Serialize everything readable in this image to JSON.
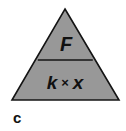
{
  "figure": {
    "caption_label": "c",
    "background_color": "#ffffff",
    "shape": {
      "name": "formula-triangle",
      "fill_color": "#989898",
      "stroke_color": "#141414",
      "stroke_width": 1.6,
      "apex": {
        "x": 65,
        "y": 9
      },
      "base_left": {
        "x": 12,
        "y": 100
      },
      "base_right": {
        "x": 119,
        "y": 100
      },
      "divider_y": 60,
      "divider_left_x": 37,
      "divider_right_x": 93
    },
    "compartments": {
      "top": {
        "name": "force-cell",
        "text": "F"
      },
      "bottom": {
        "name": "spring-constant-times-extension-cell",
        "left_term": "k",
        "operator": "×",
        "right_term": "x",
        "full_text": "k × x"
      }
    }
  }
}
